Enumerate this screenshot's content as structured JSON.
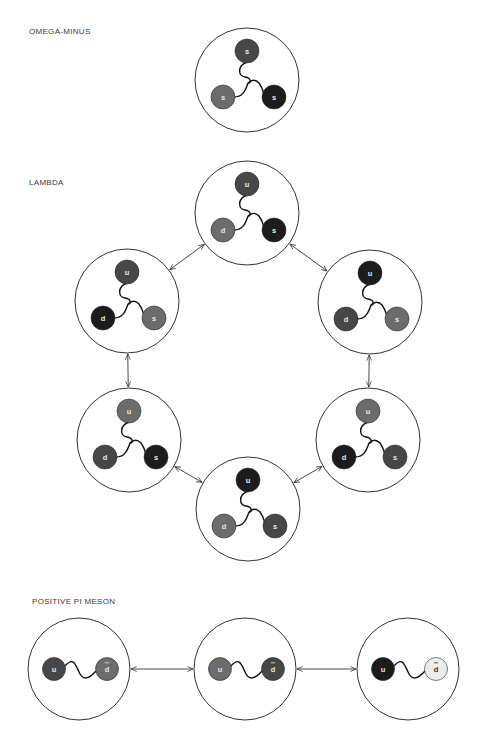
{
  "sections": {
    "omega_minus": {
      "title": "OMEGA-MINUS"
    },
    "lambda": {
      "title": "LAMBDA"
    },
    "pi_meson": {
      "title": "POSITIVE PI MESON"
    }
  },
  "colors": {
    "black": "#1c1c1c",
    "dark": "#474747",
    "mid": "#6c6c6c",
    "light": "#ececec",
    "outline": "#333333"
  },
  "omega_minus": {
    "circle": {
      "cx": 247,
      "cy": 80,
      "r": 52
    },
    "quarks": [
      {
        "label": "s",
        "shade": "dark"
      },
      {
        "label": "s",
        "shade": "mid"
      },
      {
        "label": "s",
        "shade": "black"
      }
    ]
  },
  "lambda": {
    "states": [
      {
        "cx": 247,
        "cy": 213,
        "quarks": [
          {
            "label": "u",
            "shade": "dark"
          },
          {
            "label": "d",
            "shade": "mid"
          },
          {
            "label": "s",
            "shade": "black"
          }
        ]
      },
      {
        "cx": 127,
        "cy": 301,
        "quarks": [
          {
            "label": "u",
            "shade": "dark"
          },
          {
            "label": "d",
            "shade": "black"
          },
          {
            "label": "s",
            "shade": "mid"
          }
        ]
      },
      {
        "cx": 370,
        "cy": 302,
        "quarks": [
          {
            "label": "u",
            "shade": "black"
          },
          {
            "label": "d",
            "shade": "dark"
          },
          {
            "label": "s",
            "shade": "mid"
          }
        ]
      },
      {
        "cx": 129,
        "cy": 440,
        "quarks": [
          {
            "label": "u",
            "shade": "mid"
          },
          {
            "label": "d",
            "shade": "dark"
          },
          {
            "label": "s",
            "shade": "black"
          }
        ]
      },
      {
        "cx": 368,
        "cy": 440,
        "quarks": [
          {
            "label": "u",
            "shade": "mid"
          },
          {
            "label": "d",
            "shade": "black"
          },
          {
            "label": "s",
            "shade": "dark"
          }
        ]
      },
      {
        "cx": 248,
        "cy": 509,
        "quarks": [
          {
            "label": "u",
            "shade": "black"
          },
          {
            "label": "d",
            "shade": "mid"
          },
          {
            "label": "s",
            "shade": "dark"
          }
        ]
      }
    ],
    "transitions": [
      [
        0,
        1
      ],
      [
        0,
        2
      ],
      [
        1,
        3
      ],
      [
        2,
        4
      ],
      [
        3,
        5
      ],
      [
        4,
        5
      ]
    ]
  },
  "pi_meson": {
    "states": [
      {
        "cx": 79,
        "cy": 669,
        "quarks": [
          {
            "label": "u",
            "shade": "dark"
          },
          {
            "label": "d",
            "shade": "mid",
            "antiparticle": true
          }
        ]
      },
      {
        "cx": 245,
        "cy": 669,
        "quarks": [
          {
            "label": "u",
            "shade": "mid"
          },
          {
            "label": "d",
            "shade": "dark",
            "antiparticle": true
          }
        ]
      },
      {
        "cx": 408,
        "cy": 669,
        "quarks": [
          {
            "label": "u",
            "shade": "black"
          },
          {
            "label": "d",
            "shade": "light",
            "antiparticle": true
          }
        ]
      }
    ],
    "transitions": [
      [
        0,
        1
      ],
      [
        1,
        2
      ]
    ]
  }
}
